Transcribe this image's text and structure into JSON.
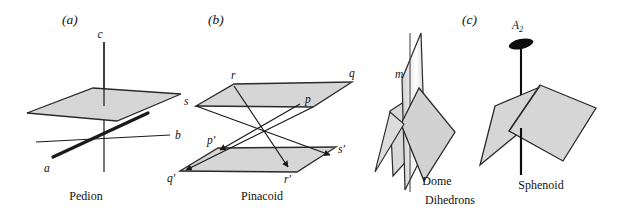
{
  "figure": {
    "background_color": "#ffffff",
    "face_fill": "#d6d6d6",
    "face_stroke": "#2a2a2a",
    "line_color": "#1a1a1a",
    "axis_symbol_color": "#0d0d0d"
  },
  "panels": [
    {
      "letter": "(a)",
      "caption": "Pedion",
      "axes": [
        {
          "name": "c",
          "label": "c"
        },
        {
          "name": "b",
          "label": "b"
        },
        {
          "name": "a",
          "label": "a"
        }
      ]
    },
    {
      "letter": "(b)",
      "caption": "Pinacoid",
      "vertices_upper": [
        {
          "name": "r",
          "label": "r"
        },
        {
          "name": "q",
          "label": "q"
        },
        {
          "name": "s",
          "label": "s"
        },
        {
          "name": "p",
          "label": "p"
        }
      ],
      "vertices_lower": [
        {
          "name": "p-prime",
          "label": "p′"
        },
        {
          "name": "q-prime",
          "label": "q′"
        },
        {
          "name": "s-prime",
          "label": "s′"
        },
        {
          "name": "r-prime",
          "label": "r′"
        }
      ]
    },
    {
      "letter": "(c)",
      "caption": "Dihedrons",
      "forms": [
        {
          "name": "dome",
          "caption": "Dome",
          "symmetry_label": "m",
          "symmetry_element": "mirror-plane"
        },
        {
          "name": "sphenoid",
          "caption": "Sphenoid",
          "symmetry_label": "A",
          "symmetry_subscript": "2",
          "symmetry_element": "two-fold-rotation-axis"
        }
      ]
    }
  ],
  "captions": {
    "pedion": "Pedion",
    "pinacoid": "Pinacoid",
    "dome": "Dome",
    "sphenoid": "Sphenoid",
    "dihedrons": "Dihedrons"
  }
}
